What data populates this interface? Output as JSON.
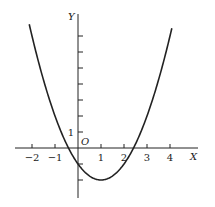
{
  "chart_data": {
    "type": "line",
    "title": "",
    "function": "y = x^2 - 2x - 1",
    "xlabel": "X",
    "ylabel": "Y",
    "origin_label": "O",
    "x_ticks": [
      -2,
      -1,
      1,
      2,
      3,
      4
    ],
    "x_tick_labels": [
      "−2",
      "−1",
      "1",
      "2",
      "3",
      "4"
    ],
    "y_tick_labels": [
      "1"
    ],
    "y_ticks": [
      -2,
      -1,
      1,
      2,
      3,
      4,
      5,
      6,
      7
    ],
    "xlim": [
      -2.6,
      5
    ],
    "ylim": [
      -3.4,
      8.2
    ],
    "grid": false,
    "series": [
      {
        "name": "parabola",
        "x": [
          -2.1,
          -2,
          -1.5,
          -1,
          -0.5,
          -0.414,
          0,
          0.5,
          1,
          1.5,
          2,
          2.414,
          2.5,
          3,
          3.5,
          4,
          4.1
        ],
        "y": [
          7.61,
          7,
          4.25,
          2,
          0.25,
          0,
          -1,
          -1.75,
          -2,
          -1.75,
          -1,
          0,
          0.25,
          2,
          4.25,
          7,
          7.61
        ]
      }
    ],
    "vertex": [
      1,
      -2
    ],
    "y_intercept": -1,
    "roots": [
      -0.414,
      2.414
    ]
  }
}
